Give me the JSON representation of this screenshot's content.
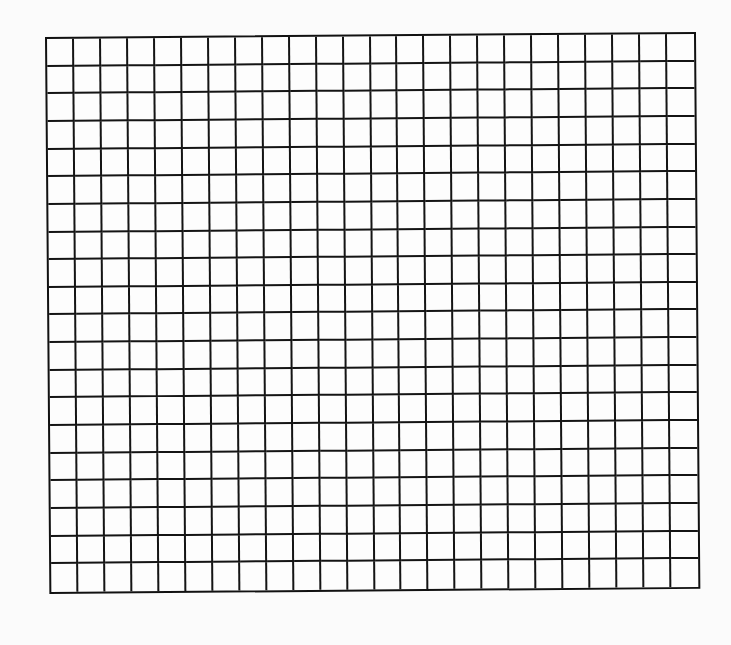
{
  "grid": {
    "columns": 24,
    "rows": 20,
    "line_color": "#111111",
    "background_color": "#fbfbfb"
  }
}
